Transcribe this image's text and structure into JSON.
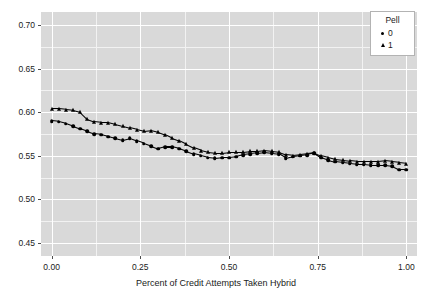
{
  "chart_data": {
    "type": "scatter",
    "title": "",
    "xlabel": "Percent of Credit Attempts Taken Hybrid",
    "ylabel": "",
    "xlim": [
      -0.03,
      1.03
    ],
    "ylim": [
      0.435,
      0.715
    ],
    "grid": true,
    "legend_position": "top-right",
    "legend_title": "Pell",
    "xticks": [
      "0.00",
      "0.25",
      "0.50",
      "0.75",
      "1.00"
    ],
    "xtick_values": [
      0.0,
      0.25,
      0.5,
      0.75,
      1.0
    ],
    "yticks": [
      "0.45",
      "0.50",
      "0.55",
      "0.60",
      "0.65",
      "0.70"
    ],
    "ytick_values": [
      0.45,
      0.5,
      0.55,
      0.6,
      0.65,
      0.7
    ],
    "series": [
      {
        "name": "0",
        "marker": "circle",
        "color": "#000000",
        "x": [
          0.0,
          0.02,
          0.04,
          0.06,
          0.08,
          0.1,
          0.12,
          0.14,
          0.16,
          0.18,
          0.2,
          0.22,
          0.24,
          0.26,
          0.28,
          0.3,
          0.32,
          0.34,
          0.36,
          0.38,
          0.4,
          0.42,
          0.44,
          0.46,
          0.48,
          0.5,
          0.52,
          0.54,
          0.56,
          0.58,
          0.6,
          0.62,
          0.64,
          0.66,
          0.68,
          0.7,
          0.72,
          0.74,
          0.76,
          0.78,
          0.8,
          0.82,
          0.84,
          0.86,
          0.88,
          0.9,
          0.92,
          0.94,
          0.96,
          0.98,
          1.0
        ],
        "y": [
          0.59,
          0.589,
          0.587,
          0.584,
          0.581,
          0.578,
          0.575,
          0.574,
          0.572,
          0.57,
          0.568,
          0.57,
          0.567,
          0.564,
          0.561,
          0.558,
          0.56,
          0.56,
          0.558,
          0.555,
          0.552,
          0.55,
          0.548,
          0.547,
          0.548,
          0.548,
          0.549,
          0.551,
          0.552,
          0.553,
          0.554,
          0.553,
          0.552,
          0.547,
          0.549,
          0.55,
          0.551,
          0.553,
          0.548,
          0.545,
          0.543,
          0.542,
          0.541,
          0.54,
          0.54,
          0.539,
          0.539,
          0.539,
          0.538,
          0.534,
          0.534
        ]
      },
      {
        "name": "1",
        "marker": "triangle",
        "color": "#000000",
        "x": [
          0.0,
          0.02,
          0.04,
          0.06,
          0.08,
          0.1,
          0.12,
          0.14,
          0.16,
          0.18,
          0.2,
          0.22,
          0.24,
          0.26,
          0.28,
          0.3,
          0.32,
          0.34,
          0.36,
          0.38,
          0.4,
          0.42,
          0.44,
          0.46,
          0.48,
          0.5,
          0.52,
          0.54,
          0.56,
          0.58,
          0.6,
          0.62,
          0.64,
          0.66,
          0.68,
          0.7,
          0.72,
          0.74,
          0.76,
          0.78,
          0.8,
          0.82,
          0.84,
          0.86,
          0.88,
          0.9,
          0.92,
          0.94,
          0.96,
          0.98,
          1.0
        ],
        "y": [
          0.604,
          0.604,
          0.603,
          0.602,
          0.6,
          0.592,
          0.589,
          0.588,
          0.588,
          0.586,
          0.584,
          0.582,
          0.58,
          0.578,
          0.579,
          0.577,
          0.574,
          0.57,
          0.567,
          0.563,
          0.559,
          0.556,
          0.554,
          0.553,
          0.553,
          0.554,
          0.554,
          0.554,
          0.555,
          0.555,
          0.556,
          0.555,
          0.554,
          0.551,
          0.55,
          0.551,
          0.552,
          0.553,
          0.55,
          0.548,
          0.546,
          0.545,
          0.544,
          0.543,
          0.543,
          0.543,
          0.543,
          0.544,
          0.543,
          0.542,
          0.541
        ]
      }
    ]
  },
  "axes": {
    "x_title": "Percent of Credit Attempts Taken Hybrid",
    "x_tick_labels": [
      "0.00",
      "0.25",
      "0.50",
      "0.75",
      "1.00"
    ],
    "y_tick_labels": [
      "0.70",
      "0.65",
      "0.60",
      "0.55",
      "0.50",
      "0.45"
    ]
  },
  "legend": {
    "title": "Pell",
    "items": [
      {
        "label": "0",
        "marker": "circle"
      },
      {
        "label": "1",
        "marker": "triangle"
      }
    ]
  },
  "colors": {
    "panel_background": "#d9d9d9",
    "major_gridline": "#ffffff",
    "minor_gridline": "#f2f2f2",
    "data": "#000000",
    "text": "#1a1a1a",
    "legend_background": "#ffffff",
    "legend_border": "#b3b3b3"
  }
}
